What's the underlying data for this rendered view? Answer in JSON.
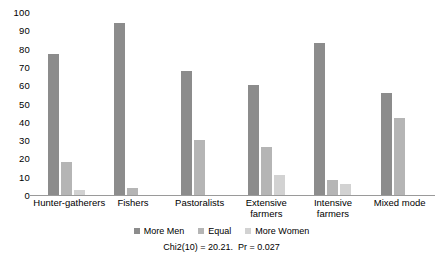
{
  "chart_data": {
    "type": "bar",
    "title": "",
    "subtitle": "",
    "xlabel": "",
    "ylabel": "",
    "ylim": [
      0,
      100
    ],
    "yticks": [
      100,
      90,
      80,
      70,
      60,
      50,
      40,
      30,
      20,
      10,
      0
    ],
    "grid": false,
    "legend_position": "bottom",
    "categories": [
      "Hunter-gatherers",
      "Fishers",
      "Pastoralists",
      "Extensive farmers",
      "Intensive farmers",
      "Mixed mode"
    ],
    "category_lines": [
      [
        "Hunter-gatherers"
      ],
      [
        "Fishers"
      ],
      [
        "Pastoralists"
      ],
      [
        "Extensive",
        "farmers"
      ],
      [
        "Intensive",
        "farmers"
      ],
      [
        "Mixed mode"
      ]
    ],
    "series": [
      {
        "name": "More Men",
        "color": "#8c8c8c",
        "values": [
          77,
          94,
          68,
          60,
          83,
          56
        ]
      },
      {
        "name": "Equal",
        "color": "#b5b5b5",
        "values": [
          18,
          4,
          30,
          26,
          8,
          42
        ]
      },
      {
        "name": "More Women",
        "color": "#d2d2d2",
        "values": [
          3,
          0,
          0,
          11,
          6,
          0
        ]
      }
    ],
    "annotation": "Chi2(10) = 20.21.  Pr = 0.027"
  },
  "legend": {
    "items": [
      {
        "label": "More Men"
      },
      {
        "label": "Equal"
      },
      {
        "label": "More Women"
      }
    ]
  }
}
